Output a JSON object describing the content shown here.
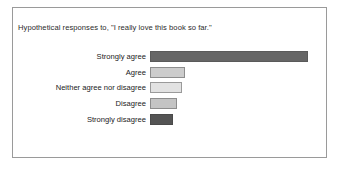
{
  "chart": {
    "title": "Hypothetical responses to, \"I really love this book so far.\"",
    "frame_border_color": "#9a9a9a",
    "background_color": "#ffffff",
    "text_color": "#222222"
  },
  "chart_data": {
    "type": "bar",
    "orientation": "horizontal",
    "title": "Hypothetical responses to, \"I really love this book so far.\"",
    "xlabel": "",
    "ylabel": "",
    "grid": false,
    "legend": "none",
    "axis_visible": false,
    "tick_labels_visible": false,
    "categories": [
      "Strongly agree",
      "Agree",
      "Neither agree nor disagree",
      "Disagree",
      "Strongly disagree"
    ],
    "values": [
      158,
      35,
      32,
      27,
      23
    ],
    "value_units": "pixels (bar length; no numeric axis shown)",
    "bar_colors": [
      "#666666",
      "#cccccc",
      "#e2e2e2",
      "#c4c4c4",
      "#545454"
    ],
    "bar_border_colors": [
      "#5a5a5a",
      "#8d8d8d",
      "#9a9a9a",
      "#8d8d8d",
      "#4a4a4a"
    ],
    "bars": [
      {
        "label": "Strongly agree",
        "value": 158,
        "fill": "#666666",
        "stroke": "#5a5a5a"
      },
      {
        "label": "Agree",
        "value": 35,
        "fill": "#cccccc",
        "stroke": "#8d8d8d"
      },
      {
        "label": "Neither agree nor disagree",
        "value": 32,
        "fill": "#e2e2e2",
        "stroke": "#9a9a9a"
      },
      {
        "label": "Disagree",
        "value": 27,
        "fill": "#c4c4c4",
        "stroke": "#8d8d8d"
      },
      {
        "label": "Strongly disagree",
        "value": 23,
        "fill": "#545454",
        "stroke": "#4a4a4a"
      }
    ]
  }
}
